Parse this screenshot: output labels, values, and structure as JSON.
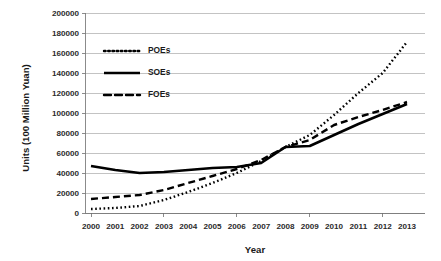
{
  "chart_data": {
    "type": "line",
    "title": "",
    "xlabel": "Year",
    "ylabel": "Units (100 Million Yuan)",
    "categories": [
      "2000",
      "2001",
      "2002",
      "2003",
      "2004",
      "2005",
      "2006",
      "2007",
      "2008",
      "2009",
      "2010",
      "2011",
      "2012",
      "2013"
    ],
    "x": [
      2000,
      2001,
      2002,
      2003,
      2004,
      2005,
      2006,
      2007,
      2008,
      2009,
      2010,
      2011,
      2012,
      2013
    ],
    "ylim": [
      0,
      200000
    ],
    "xlim": [
      2000,
      2013
    ],
    "ytick_labels": [
      "0",
      "20000",
      "40000",
      "60000",
      "80000",
      "100000",
      "120000",
      "140000",
      "160000",
      "180000",
      "200000"
    ],
    "ytick_values": [
      0,
      20000,
      40000,
      60000,
      80000,
      100000,
      120000,
      140000,
      160000,
      180000,
      200000
    ],
    "grid": true,
    "grid_axis": "y",
    "legend_position": "upper-left-inside",
    "series": [
      {
        "name": "POEs",
        "style": "dotted",
        "color": "#000000",
        "values": [
          4000,
          5000,
          7000,
          13000,
          21000,
          30000,
          40000,
          52000,
          66000,
          78000,
          98000,
          120000,
          140000,
          171000
        ]
      },
      {
        "name": "SOEs",
        "style": "solid",
        "color": "#000000",
        "values": [
          47000,
          43000,
          40000,
          41000,
          43000,
          45000,
          46000,
          50000,
          66000,
          67000,
          78000,
          89000,
          99000,
          109000
        ]
      },
      {
        "name": "FOEs",
        "style": "dashed",
        "color": "#000000",
        "values": [
          14000,
          16000,
          18000,
          23000,
          30000,
          37000,
          44000,
          53000,
          66000,
          73000,
          88000,
          96000,
          103000,
          111000
        ]
      }
    ]
  },
  "legend": {
    "items": [
      {
        "label": "POEs",
        "style": "dotted"
      },
      {
        "label": "SOEs",
        "style": "solid"
      },
      {
        "label": "FOEs",
        "style": "dashed"
      }
    ]
  },
  "axes": {
    "x_title": "Year",
    "y_title": "Units (100 Million Yuan)"
  }
}
